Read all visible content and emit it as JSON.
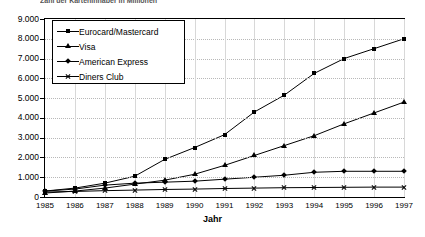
{
  "title_clipped": "Zahl der Karteninhaber in Millionen",
  "chart_data": {
    "type": "line",
    "title": "",
    "xlabel": "Jahr",
    "ylabel": "",
    "grid": true,
    "legend_position": "top-left-inside",
    "x": [
      1985,
      1986,
      1987,
      1988,
      1989,
      1990,
      1991,
      1992,
      1993,
      1994,
      1995,
      1996,
      1997
    ],
    "categories": [
      "1985",
      "1986",
      "1987",
      "1988",
      "1989",
      "1990",
      "1991",
      "1992",
      "1993",
      "1994",
      "1995",
      "1996",
      "1997"
    ],
    "ylim": [
      0,
      9000
    ],
    "yticks": [
      0,
      1000,
      2000,
      3000,
      4000,
      5000,
      6000,
      7000,
      8000,
      9000
    ],
    "ytick_labels": [
      "0",
      "1.000",
      "2.000",
      "3.000",
      "4.000",
      "5.000",
      "6.000",
      "7.000",
      "8.000",
      "9.000"
    ],
    "series": [
      {
        "name": "Eurocard/Mastercard",
        "marker": "square",
        "values": [
          300,
          450,
          700,
          1050,
          1900,
          2500,
          3150,
          4300,
          5150,
          6250,
          7000,
          7500,
          8000
        ]
      },
      {
        "name": "Visa",
        "marker": "triangle",
        "values": [
          200,
          300,
          450,
          650,
          850,
          1150,
          1600,
          2100,
          2600,
          3100,
          3700,
          4250,
          4800
        ]
      },
      {
        "name": "American Express",
        "marker": "diamond",
        "values": [
          300,
          400,
          600,
          700,
          750,
          800,
          900,
          1000,
          1100,
          1250,
          1300,
          1300,
          1300
        ]
      },
      {
        "name": "Diners Club",
        "marker": "cross",
        "values": [
          250,
          280,
          320,
          350,
          380,
          400,
          430,
          450,
          470,
          480,
          490,
          500,
          500
        ]
      }
    ]
  },
  "legend": {
    "items": [
      {
        "label": "Eurocard/Mastercard",
        "marker": "square"
      },
      {
        "label": "Visa",
        "marker": "triangle"
      },
      {
        "label": "American Express",
        "marker": "diamond"
      },
      {
        "label": "Diners Club",
        "marker": "cross"
      }
    ]
  },
  "axis": {
    "x_title": "Jahr"
  }
}
